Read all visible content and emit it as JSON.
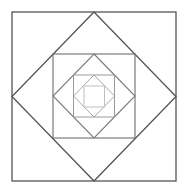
{
  "diagram": {
    "background": "#ffffff",
    "shapes": [
      {
        "name": "square-1",
        "type": "rect",
        "x": 12,
        "y": 12,
        "w": 164,
        "h": 169,
        "stroke": "#555555",
        "stroke_width": 1.3
      },
      {
        "name": "diamond-1",
        "type": "polygon",
        "points": "94,12 176,96.5 94,181 12,96.5",
        "stroke": "#555555",
        "stroke_width": 1.3
      },
      {
        "name": "square-2",
        "type": "rect",
        "x": 53,
        "y": 54,
        "w": 82,
        "h": 84,
        "stroke": "#6e6e6e",
        "stroke_width": 1.1
      },
      {
        "name": "diamond-2",
        "type": "polygon",
        "points": "94,54 135,96 94,138 53,96",
        "stroke": "#7a7a7a",
        "stroke_width": 1.1
      },
      {
        "name": "square-3",
        "type": "rect",
        "x": 73.5,
        "y": 75,
        "w": 41,
        "h": 42,
        "stroke": "#9a9a9a",
        "stroke_width": 1
      },
      {
        "name": "diamond-3",
        "type": "polygon",
        "points": "94,75 114.5,96 94,117 73.5,96",
        "stroke": "#a8a8a8",
        "stroke_width": 1
      },
      {
        "name": "square-4",
        "type": "rect",
        "x": 84,
        "y": 86,
        "w": 20.5,
        "h": 21,
        "stroke": "#c0c0c0",
        "stroke_width": 1
      }
    ]
  }
}
